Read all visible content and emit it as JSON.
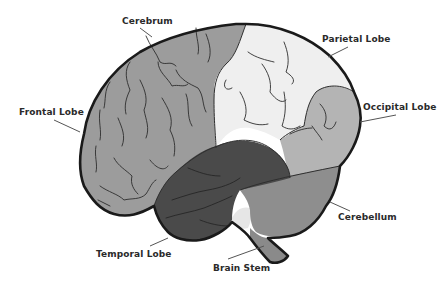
{
  "diagram": {
    "colors": {
      "background": "#ffffff",
      "outline": "#1a1a1a",
      "frontal_lobe": "#9c9c9c",
      "parietal_lobe": "#efefef",
      "occipital_lobe": "#b4b4b4",
      "temporal_lobe": "#4a4a4a",
      "cerebellum": "#8e8e8e",
      "brain_stem": "#8a8a8a",
      "gap": "#e6e6e6",
      "sulci": "#2e2e2e",
      "leader_line": "#555555",
      "label_text": "#2a2a2a"
    },
    "labels": [
      {
        "id": "cerebrum",
        "text": "Cerebrum"
      },
      {
        "id": "parietal-lobe",
        "text": "Parietal Lobe"
      },
      {
        "id": "frontal-lobe",
        "text": "Frontal Lobe"
      },
      {
        "id": "occipital-lobe",
        "text": "Occipital Lobe"
      },
      {
        "id": "cerebellum",
        "text": "Cerebellum"
      },
      {
        "id": "temporal-lobe",
        "text": "Temporal Lobe"
      },
      {
        "id": "brain-stem",
        "text": "Brain Stem"
      }
    ]
  }
}
